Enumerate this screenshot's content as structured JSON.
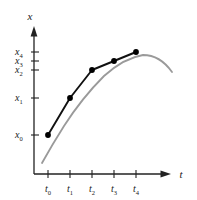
{
  "figure": {
    "title": "",
    "axes": {
      "y_axis_label": "x",
      "x_axis_label": "t"
    },
    "y_ticks": [
      {
        "base": "x",
        "sub": "0"
      },
      {
        "base": "x",
        "sub": "1"
      },
      {
        "base": "x",
        "sub": "2"
      },
      {
        "base": "x",
        "sub": "3"
      },
      {
        "base": "x",
        "sub": "4"
      }
    ],
    "x_ticks": [
      {
        "base": "t",
        "sub": "0"
      },
      {
        "base": "t",
        "sub": "1"
      },
      {
        "base": "t",
        "sub": "2"
      },
      {
        "base": "t",
        "sub": "3"
      },
      {
        "base": "t",
        "sub": "4"
      }
    ],
    "colors": {
      "smooth_curve": "#9a9a9a",
      "polyline": "#111111",
      "marker": "#000000",
      "axis": "#222222",
      "background": "#ffffff",
      "border": "#cccccc"
    }
  },
  "chart_data": {
    "type": "line",
    "title": "",
    "xlabel": "t",
    "ylabel": "x",
    "grid": false,
    "legend": "none",
    "categories": [
      "t0",
      "t1",
      "t2",
      "t3",
      "t4"
    ],
    "x_tick_labels": [
      "t₀",
      "t₁",
      "t₂",
      "t₃",
      "t₄"
    ],
    "y_tick_labels": [
      "x₀",
      "x₁",
      "x₂",
      "x₃",
      "x₄"
    ],
    "x": [
      48,
      70,
      92,
      114,
      136
    ],
    "values": [
      135,
      98,
      70,
      61,
      52
    ],
    "series": [
      {
        "name": "sampled-points-polyline",
        "x": [
          48,
          70,
          92,
          114,
          136
        ],
        "values": [
          135,
          98,
          70,
          61,
          52
        ],
        "markers": true,
        "color": "#111111"
      },
      {
        "name": "underlying-smooth-curve",
        "path": "M 42 163 Q 52 145 64 126 Q 82 98 104 76 Q 124 58 143 55 Q 160 55 172 72",
        "markers": false,
        "color": "#9a9a9a"
      }
    ],
    "xlim": [
      30,
      180
    ],
    "ylim": [
      175,
      30
    ],
    "annotations": [
      "Black polyline with five round markers approximates a smooth gray curve",
      "Gray curve extends beyond the sampled interval on both ends",
      "Curve rises steeply then flattens near t4 and turns over"
    ]
  }
}
